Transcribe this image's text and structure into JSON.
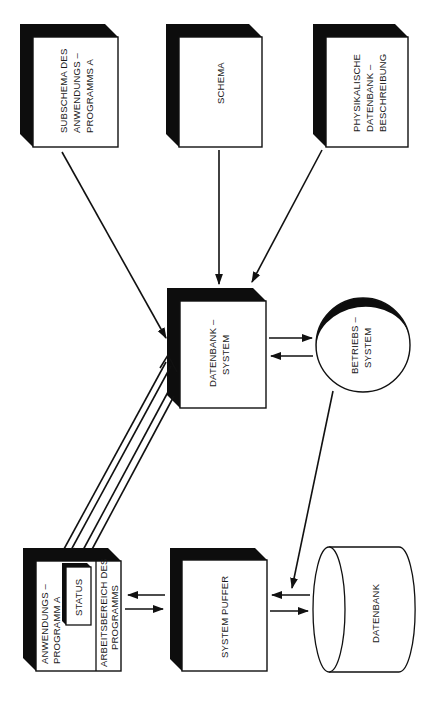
{
  "diagram": {
    "orientation": "rotated 90 degrees counter-clockwise",
    "nodes": {
      "subschema": {
        "lines": [
          "SUBSCHEMA DES",
          "ANWENDUNGS –",
          "PROGRAMMS  A"
        ]
      },
      "schema": {
        "lines": [
          "SCHEMA"
        ]
      },
      "physikalische": {
        "lines": [
          "PHYSIKALISCHE",
          "DATENBANK –",
          "BESCHREIBUNG"
        ]
      },
      "datenbank_system": {
        "lines": [
          "DATENBANK –",
          "SYSTEM"
        ]
      },
      "betriebs_system": {
        "lines": [
          "BETRIEBS –",
          "SYSTEM"
        ]
      },
      "anwendungsprogramm": {
        "lines": [
          "ANWENDUNGS –",
          "PROGRAMM  A"
        ]
      },
      "status": {
        "lines": [
          "STATUS"
        ]
      },
      "arbeitsbereich": {
        "lines": [
          "ARBEITSBEREICH DES",
          "PROGRAMMS"
        ]
      },
      "system_puffer": {
        "lines": [
          "SYSTEM   PUFFER"
        ]
      },
      "datenbank": {
        "lines": [
          "DATENBANK"
        ]
      }
    },
    "edges": [
      {
        "from": "subschema",
        "to": "datenbank_system"
      },
      {
        "from": "schema",
        "to": "datenbank_system"
      },
      {
        "from": "physikalische",
        "to": "datenbank_system"
      },
      {
        "from": "datenbank_system",
        "to": "betriebs_system"
      },
      {
        "from": "betriebs_system",
        "to": "datenbank_system"
      },
      {
        "from": "anwendungsprogramm",
        "to": "datenbank_system",
        "style": "hollow-double"
      },
      {
        "from": "datenbank_system",
        "to": "status",
        "style": "hollow-double"
      },
      {
        "from": "system_puffer",
        "to": "arbeitsbereich"
      },
      {
        "from": "arbeitsbereich",
        "to": "system_puffer"
      },
      {
        "from": "datenbank",
        "to": "system_puffer"
      },
      {
        "from": "system_puffer",
        "to": "datenbank"
      },
      {
        "from": "betriebs_system",
        "to": "system_puffer"
      }
    ]
  }
}
